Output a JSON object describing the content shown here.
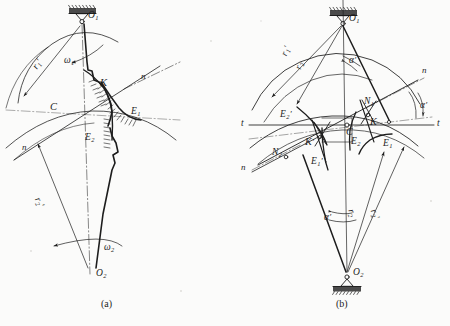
{
  "figure": {
    "background_color": "#fbfbfa",
    "ink_color": "#1d1d1d",
    "subfigures": [
      {
        "id": "a",
        "caption": "(a)",
        "caption_x": 106,
        "caption_y": 305
      },
      {
        "id": "b",
        "caption": "(b)",
        "caption_x": 341,
        "caption_y": 305
      }
    ]
  },
  "panel_a": {
    "caption": "(a)",
    "pivots": [
      {
        "name": "O1",
        "label": "O",
        "sub": "1",
        "x": 82,
        "y": 17
      },
      {
        "name": "O2",
        "label": "O",
        "sub": "2",
        "x": 90,
        "y": 277
      }
    ],
    "labels": [
      {
        "name": "pivot-o1-label",
        "text": "O",
        "sub": "1",
        "prime": "",
        "x": 88,
        "y": 15,
        "rot": ""
      },
      {
        "name": "pivot-o2-label",
        "text": "O",
        "sub": "2",
        "prime": "",
        "x": 96,
        "y": 273,
        "rot": ""
      },
      {
        "name": "radius-r1-prime",
        "text": "r",
        "sub": "1",
        "prime": "'",
        "x": 27,
        "y": 58,
        "rot": "rot-a"
      },
      {
        "name": "radius-r2-prime",
        "text": "r",
        "sub": "2",
        "prime": "'",
        "x": 40,
        "y": 200,
        "rot": "rot-c"
      },
      {
        "name": "omega1-label",
        "text": "ω",
        "sub": "1",
        "prime": "",
        "x": 67,
        "y": 61,
        "rot": ""
      },
      {
        "name": "omega2-label",
        "text": "ω",
        "sub": "2",
        "prime": "",
        "x": 105,
        "y": 248,
        "rot": ""
      },
      {
        "name": "pitch-point-c",
        "text": "C",
        "sub": "",
        "prime": "",
        "x": 52,
        "y": 108,
        "rot": ""
      },
      {
        "name": "contact-point-k",
        "text": "K",
        "sub": "",
        "prime": "",
        "x": 102,
        "y": 84,
        "rot": ""
      },
      {
        "name": "profile-e1",
        "text": "E",
        "sub": "1",
        "prime": "",
        "x": 133,
        "y": 113,
        "rot": ""
      },
      {
        "name": "profile-e2",
        "text": "E",
        "sub": "2",
        "prime": "",
        "x": 87,
        "y": 138,
        "rot": ""
      },
      {
        "name": "normal-n-upper",
        "text": "n",
        "sub": "",
        "prime": "",
        "x": 142,
        "y": 78,
        "rot": ""
      },
      {
        "name": "normal-n-lower",
        "text": "n",
        "sub": "",
        "prime": "",
        "x": 22,
        "y": 148,
        "rot": ""
      }
    ]
  },
  "panel_b": {
    "caption": "(b)",
    "pivots": [
      {
        "name": "O1",
        "label": "O",
        "sub": "1",
        "x": 343,
        "y": 19
      },
      {
        "name": "O2",
        "label": "O",
        "sub": "2",
        "x": 347,
        "y": 276
      }
    ],
    "labels": [
      {
        "name": "pivot-o1-label",
        "text": "O",
        "sub": "1",
        "prime": "",
        "x": 349,
        "y": 18,
        "rot": ""
      },
      {
        "name": "pivot-o2-label",
        "text": "O",
        "sub": "2",
        "prime": "",
        "x": 353,
        "y": 272,
        "rot": ""
      },
      {
        "name": "radius-r1-prime",
        "text": "r",
        "sub": "1",
        "prime": "'",
        "x": 277,
        "y": 48,
        "rot": "rot-e"
      },
      {
        "name": "radius-r2-b",
        "text": "r",
        "sub": "2",
        "prime": "",
        "x": 291,
        "y": 62,
        "rot": "rot-f"
      },
      {
        "name": "radius-r2-lower",
        "text": "r",
        "sub": "2",
        "prime": "",
        "x": 357,
        "y": 215,
        "rot": "rot-g"
      },
      {
        "name": "radius-r2-prime",
        "text": "r",
        "sub": "2",
        "prime": "'",
        "x": 379,
        "y": 214,
        "rot": "rot-h"
      },
      {
        "name": "alpha-prime-top",
        "text": "α",
        "sub": "",
        "prime": "'",
        "x": 350,
        "y": 62,
        "rot": ""
      },
      {
        "name": "alpha-prime-right",
        "text": "α",
        "sub": "",
        "prime": "'",
        "x": 421,
        "y": 107,
        "rot": ""
      },
      {
        "name": "alpha-prime-bottom",
        "text": "α",
        "sub": "",
        "prime": "'",
        "x": 325,
        "y": 219,
        "rot": ""
      },
      {
        "name": "pitch-point-c",
        "text": "C",
        "sub": "",
        "prime": "",
        "x": 347,
        "y": 133,
        "rot": ""
      },
      {
        "name": "contact-point-k",
        "text": "K",
        "sub": "",
        "prime": "",
        "x": 370,
        "y": 122,
        "rot": ""
      },
      {
        "name": "contact-point-k-pr",
        "text": "K",
        "sub": "",
        "prime": "'",
        "x": 307,
        "y": 142,
        "rot": ""
      },
      {
        "name": "point-n1",
        "text": "N",
        "sub": "1",
        "prime": "",
        "x": 365,
        "y": 102,
        "rot": ""
      },
      {
        "name": "point-n2",
        "text": "N",
        "sub": "2",
        "prime": "",
        "x": 274,
        "y": 152,
        "rot": ""
      },
      {
        "name": "profile-e1",
        "text": "E",
        "sub": "1",
        "prime": "",
        "x": 383,
        "y": 143,
        "rot": ""
      },
      {
        "name": "profile-e2",
        "text": "E",
        "sub": "2",
        "prime": "",
        "x": 352,
        "y": 142,
        "rot": ""
      },
      {
        "name": "profile-e1-prime",
        "text": "E",
        "sub": "1",
        "prime": "'",
        "x": 313,
        "y": 162,
        "rot": ""
      },
      {
        "name": "profile-e2-prime",
        "text": "E",
        "sub": "2",
        "prime": "'",
        "x": 282,
        "y": 116,
        "rot": ""
      },
      {
        "name": "tangent-t-left",
        "text": "t",
        "sub": "",
        "prime": "",
        "x": 243,
        "y": 118,
        "rot": ""
      },
      {
        "name": "tangent-t-right",
        "text": "t",
        "sub": "",
        "prime": "",
        "x": 437,
        "y": 118,
        "rot": ""
      },
      {
        "name": "normal-n-upper",
        "text": "n",
        "sub": "",
        "prime": "",
        "x": 423,
        "y": 72,
        "rot": ""
      },
      {
        "name": "normal-n-lower",
        "text": "n",
        "sub": "",
        "prime": "",
        "x": 243,
        "y": 168,
        "rot": ""
      }
    ]
  },
  "icons": {
    "ground_hatch": "ground-support-hatching",
    "pivot": "pin-joint-circle",
    "arrow": "direction-arrowhead"
  }
}
